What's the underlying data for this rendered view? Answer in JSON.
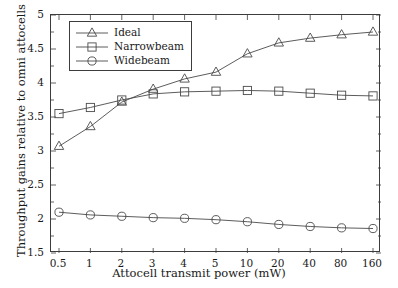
{
  "chart_data": {
    "type": "line",
    "title": "",
    "xlabel": "Attocell transmit power (mW)",
    "ylabel": "Throughput gains relative to omni attocells",
    "categories": [
      "0.5",
      "1",
      "2",
      "3",
      "4",
      "5",
      "10",
      "20",
      "40",
      "80",
      "160"
    ],
    "ylim": [
      1.5,
      5
    ],
    "yticks": [
      "1.5",
      "2",
      "2.5",
      "3",
      "3.5",
      "4",
      "4.5",
      "5"
    ],
    "ytick_values": [
      1.5,
      2,
      2.5,
      3,
      3.5,
      4,
      4.5,
      5
    ],
    "grid": false,
    "legend_position": "top-left",
    "series": [
      {
        "name": "Ideal",
        "marker": "triangle",
        "values": [
          3.07,
          3.36,
          3.72,
          3.91,
          4.06,
          4.16,
          4.43,
          4.59,
          4.66,
          4.71,
          4.75
        ]
      },
      {
        "name": "Narrowbeam",
        "marker": "square",
        "values": [
          3.55,
          3.64,
          3.75,
          3.84,
          3.87,
          3.88,
          3.89,
          3.88,
          3.85,
          3.82,
          3.81
        ]
      },
      {
        "name": "Widebeam",
        "marker": "circle",
        "values": [
          2.1,
          2.06,
          2.04,
          2.02,
          2.01,
          1.99,
          1.96,
          1.92,
          1.89,
          1.87,
          1.86
        ]
      }
    ]
  },
  "legend": {
    "items": [
      {
        "label": "Ideal",
        "marker": "triangle"
      },
      {
        "label": "Narrowbeam",
        "marker": "square"
      },
      {
        "label": "Widebeam",
        "marker": "circle"
      }
    ]
  }
}
